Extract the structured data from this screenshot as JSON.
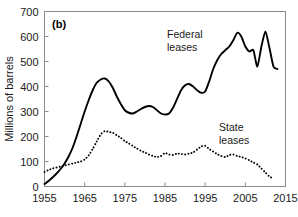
{
  "figure": {
    "panel_label": "(b)",
    "background_color": "#ffffff",
    "frame_color": "#808080"
  },
  "annotations": {
    "federal_line1": "Federal",
    "federal_line2": "leases",
    "state_line1": "State",
    "state_line2": "leases"
  },
  "chart_data": {
    "type": "line",
    "title": "",
    "subtitle": "",
    "xlabel": "",
    "ylabel": "Millions of barrels",
    "xlim": [
      1955,
      2015
    ],
    "ylim": [
      0,
      700
    ],
    "xticks": [
      1955,
      1965,
      1975,
      1985,
      1995,
      2005,
      2015
    ],
    "xtick_labels": [
      "1955",
      "1965",
      "1975",
      "1985",
      "1995",
      "2005",
      "2015"
    ],
    "yticks": [
      0,
      100,
      200,
      300,
      400,
      500,
      600,
      700
    ],
    "ytick_labels": [
      "0",
      "100",
      "200",
      "300",
      "400",
      "500",
      "600",
      "700"
    ],
    "grid": false,
    "legend_position": "inline-annotation",
    "series": [
      {
        "name": "Federal leases",
        "style": "solid",
        "color": "#000000",
        "x": [
          1955,
          1956,
          1957,
          1958,
          1959,
          1960,
          1961,
          1962,
          1963,
          1964,
          1965,
          1966,
          1967,
          1968,
          1969,
          1970,
          1971,
          1972,
          1973,
          1974,
          1975,
          1976,
          1977,
          1978,
          1979,
          1980,
          1981,
          1982,
          1983,
          1984,
          1985,
          1986,
          1987,
          1988,
          1989,
          1990,
          1991,
          1992,
          1993,
          1994,
          1995,
          1996,
          1997,
          1998,
          1999,
          2000,
          2001,
          2002,
          2003,
          2004,
          2005,
          2006,
          2007,
          2008,
          2009,
          2010,
          2011,
          2012,
          2013
        ],
        "y": [
          10,
          22,
          36,
          52,
          70,
          92,
          120,
          155,
          200,
          250,
          300,
          345,
          385,
          415,
          428,
          432,
          420,
          395,
          360,
          330,
          305,
          295,
          292,
          300,
          310,
          318,
          322,
          318,
          305,
          292,
          288,
          292,
          315,
          350,
          385,
          405,
          410,
          400,
          385,
          375,
          380,
          420,
          470,
          505,
          530,
          545,
          560,
          585,
          615,
          600,
          560,
          540,
          545,
          480,
          560,
          620,
          555,
          480,
          470
        ]
      },
      {
        "name": "State leases",
        "style": "dotted",
        "color": "#000000",
        "x": [
          1955,
          1956,
          1957,
          1958,
          1959,
          1960,
          1961,
          1962,
          1963,
          1964,
          1965,
          1966,
          1967,
          1968,
          1969,
          1970,
          1971,
          1972,
          1973,
          1974,
          1975,
          1976,
          1977,
          1978,
          1979,
          1980,
          1981,
          1982,
          1983,
          1984,
          1985,
          1986,
          1987,
          1988,
          1989,
          1990,
          1991,
          1992,
          1993,
          1994,
          1995,
          1996,
          1997,
          1998,
          1999,
          2000,
          2001,
          2002,
          2003,
          2004,
          2005,
          2006,
          2007,
          2008,
          2009,
          2010,
          2011,
          2012
        ],
        "y": [
          58,
          66,
          72,
          76,
          80,
          84,
          88,
          92,
          96,
          100,
          108,
          125,
          150,
          180,
          208,
          222,
          218,
          215,
          205,
          195,
          182,
          172,
          162,
          152,
          143,
          136,
          128,
          122,
          118,
          122,
          134,
          128,
          126,
          132,
          130,
          128,
          132,
          136,
          148,
          160,
          163,
          150,
          140,
          130,
          122,
          118,
          126,
          128,
          122,
          118,
          112,
          105,
          96,
          88,
          72,
          56,
          40,
          32
        ]
      }
    ]
  }
}
